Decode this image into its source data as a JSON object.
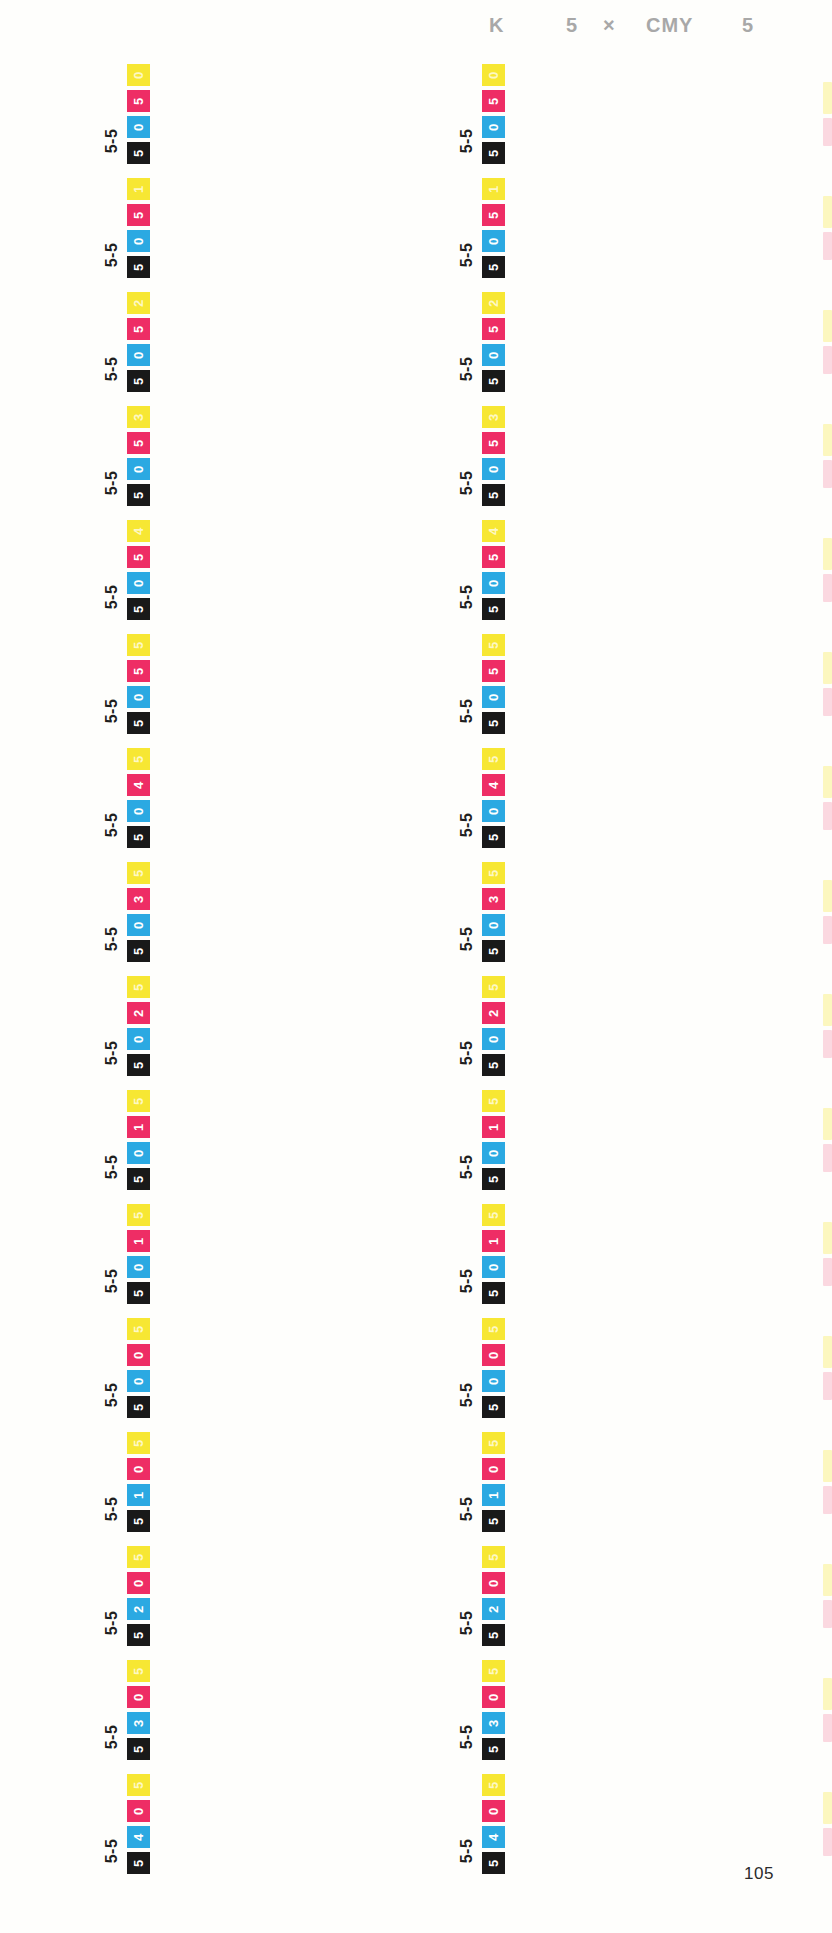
{
  "header": {
    "k_label": "K",
    "k_value": "5",
    "times": "×",
    "cmy_label": "CMY",
    "cmy_value": "5"
  },
  "page_number": "105",
  "colors": {
    "paper": "#FEFEFC",
    "yellow": "#F7E733",
    "magenta": "#EE2D65",
    "cyan": "#2BA9E2",
    "black": "#191919",
    "chip_text": "#FFFFFF",
    "yellow_chip_text": "rgba(255,252,225,0.85)",
    "label_text": "#1F1F1F",
    "header_text": "#A8A8A8"
  },
  "chip_order_top_to_bottom": [
    "yellow",
    "magenta",
    "cyan",
    "black"
  ],
  "groups": [
    {
      "label": "5-5",
      "y": "0",
      "m": "5",
      "c": "0",
      "k": "5"
    },
    {
      "label": "5-5",
      "y": "1",
      "m": "5",
      "c": "0",
      "k": "5"
    },
    {
      "label": "5-5",
      "y": "2",
      "m": "5",
      "c": "0",
      "k": "5"
    },
    {
      "label": "5-5",
      "y": "3",
      "m": "5",
      "c": "0",
      "k": "5"
    },
    {
      "label": "5-5",
      "y": "4",
      "m": "5",
      "c": "0",
      "k": "5"
    },
    {
      "label": "5-5",
      "y": "5",
      "m": "5",
      "c": "0",
      "k": "5"
    },
    {
      "label": "5-5",
      "y": "5",
      "m": "4",
      "c": "0",
      "k": "5"
    },
    {
      "label": "5-5",
      "y": "5",
      "m": "3",
      "c": "0",
      "k": "5"
    },
    {
      "label": "5-5",
      "y": "5",
      "m": "2",
      "c": "0",
      "k": "5"
    },
    {
      "label": "5-5",
      "y": "5",
      "m": "1",
      "c": "0",
      "k": "5"
    },
    {
      "label": "5-5",
      "y": "5",
      "m": "1",
      "c": "0",
      "k": "5"
    },
    {
      "label": "5-5",
      "y": "5",
      "m": "0",
      "c": "0",
      "k": "5"
    },
    {
      "label": "5-5",
      "y": "5",
      "m": "0",
      "c": "1",
      "k": "5"
    },
    {
      "label": "5-5",
      "y": "5",
      "m": "0",
      "c": "2",
      "k": "5"
    },
    {
      "label": "5-5",
      "y": "5",
      "m": "0",
      "c": "3",
      "k": "5"
    },
    {
      "label": "5-5",
      "y": "5",
      "m": "0",
      "c": "4",
      "k": "5"
    }
  ]
}
